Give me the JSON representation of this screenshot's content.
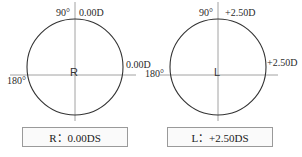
{
  "right_eye": {
    "eye_letter": "R",
    "axis_90_label": "90°",
    "axis_180_label": "180°",
    "power_90": "0.00D",
    "power_180": "0.00D",
    "result": "R：0.00DS"
  },
  "left_eye": {
    "eye_letter": "L",
    "axis_90_label": "90°",
    "axis_180_label": "180°",
    "power_90": "+2.50D",
    "power_180": "+2.50D",
    "result": "L：+2.50DS"
  },
  "colors": {
    "circle": "#333333",
    "axis": "#8a8a8a",
    "box_border": "#9a9a9a"
  }
}
